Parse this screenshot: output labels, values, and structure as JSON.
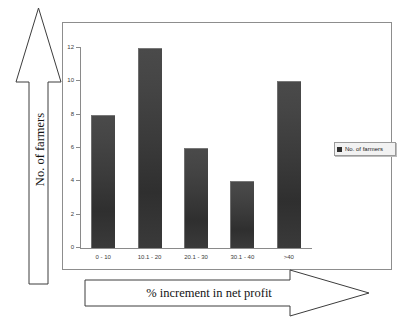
{
  "chart_data": {
    "type": "bar",
    "title": "",
    "categories": [
      "0 - 10",
      "10.1 - 20",
      "20.1 - 30",
      "30.1 - 40",
      ">40"
    ],
    "values": [
      8,
      12,
      6,
      4,
      10
    ],
    "series": [
      {
        "name": "No. of farmers",
        "values": [
          8,
          12,
          6,
          4,
          10
        ]
      }
    ],
    "xlabel": "% increment in net profit",
    "ylabel": "No. of farmers",
    "ylim": [
      0,
      12
    ],
    "yticks": [
      0,
      2,
      4,
      6,
      8,
      10,
      12
    ],
    "ytick_labels": [
      "0",
      "2",
      "4",
      "6",
      "8",
      "10",
      "12"
    ],
    "grid": false,
    "legend": {
      "position": "right",
      "entries": [
        "No. of farmers"
      ]
    },
    "bar_color": "#3a3a3a",
    "frame_color": "#8d8d8d",
    "axis_color": "#8a8a8a"
  },
  "axes": {
    "y_title": "No. of farmers",
    "x_title": "% increment in net profit"
  },
  "legend": {
    "label": "No. of farmers"
  }
}
